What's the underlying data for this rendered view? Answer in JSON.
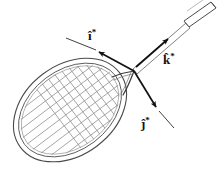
{
  "figure": {
    "background_color": "#ffffff",
    "stroke_color": "#1a1a1a",
    "outline_color": "#444444",
    "string_color": "#7a7a7a",
    "width": 223,
    "height": 181,
    "object": "badminton racket"
  },
  "labels": {
    "i_hat": {
      "base": "i",
      "hat": "̂",
      "mark": "*",
      "text": "î",
      "full": "î*"
    },
    "j_hat": {
      "base": "j",
      "hat": "̂",
      "mark": "*",
      "text": "ĵ",
      "full": "ĵ*"
    },
    "k_hat": {
      "base": "k",
      "hat": "̂",
      "mark": "*",
      "text": "k̂",
      "full": "k̂*"
    }
  },
  "vectors": [
    {
      "name": "i-hat-star",
      "label": "î*",
      "origin": [
        134,
        71
      ],
      "tip": [
        96,
        50
      ],
      "tail_extension": [
        66,
        38
      ],
      "direction": "upper-left"
    },
    {
      "name": "j-hat-star",
      "label": "ĵ*",
      "origin": [
        134,
        71
      ],
      "tip": [
        159,
        111
      ],
      "tail_extension": [
        173,
        127
      ],
      "direction": "lower-right"
    },
    {
      "name": "k-hat-star",
      "label": "k̂*",
      "origin": [
        134,
        71
      ],
      "tip": [
        166,
        38
      ],
      "tail_extension": [
        214,
        5
      ],
      "direction": "upper-right"
    }
  ],
  "racket": {
    "head": {
      "center": [
        70,
        110
      ],
      "radius_major": 62,
      "radius_minor": 44,
      "rotation_deg": -37,
      "rim_count": 2,
      "rim_gap": 4
    },
    "strings": {
      "orientation": "diagonal-crosshatch",
      "spacing": 11,
      "angle_deg": 45
    },
    "throat": {
      "junction": [
        134,
        71
      ],
      "left_arm_end": [
        113,
        78
      ],
      "right_arm_end": [
        124,
        95
      ]
    },
    "shaft": {
      "from": [
        134,
        71
      ],
      "to": [
        186,
        26
      ]
    },
    "grip": {
      "from": [
        186,
        26
      ],
      "to": [
        214,
        5
      ],
      "shape": "tapered-tube-with-endcap"
    }
  }
}
